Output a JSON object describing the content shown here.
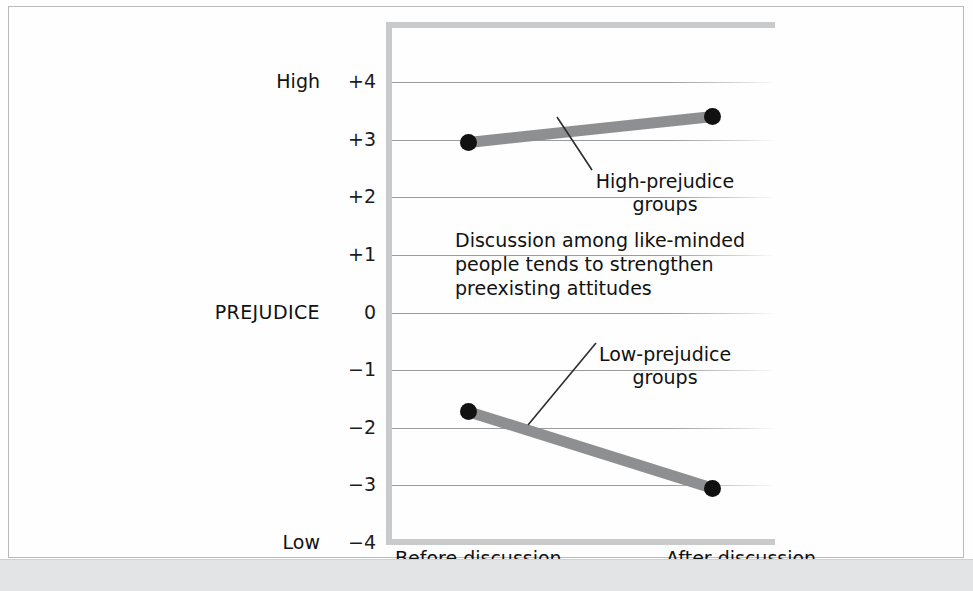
{
  "chart_data": {
    "type": "line",
    "title": "",
    "xlabel": "",
    "ylabel": "PREJUDICE",
    "ylim": [
      -4,
      4
    ],
    "grid": true,
    "legend_position": "inline-annotation",
    "categories": [
      "Before discussion",
      "After discussion"
    ],
    "ytick_labels": [
      "+4",
      "+3",
      "+2",
      "+1",
      "0",
      "−1",
      "−2",
      "−3",
      "−4"
    ],
    "ytick_values": [
      4,
      3,
      2,
      1,
      0,
      -1,
      -2,
      -3,
      -4
    ],
    "axis_end_labels": {
      "high": "High",
      "low": "Low"
    },
    "series": [
      {
        "name": "High-prejudice groups",
        "values": [
          2.95,
          3.4
        ]
      },
      {
        "name": "Low-prejudice groups",
        "values": [
          -1.72,
          -3.05
        ]
      }
    ],
    "annotations": [
      {
        "name": "high-prejudice-label",
        "text_line1": "High-prejudice",
        "text_line2": "groups"
      },
      {
        "name": "low-prejudice-label",
        "text_line1": "Low-prejudice",
        "text_line2": "groups"
      },
      {
        "name": "conclusion-note",
        "text_line1": "Discussion among like-minded",
        "text_line2": "people tends to strengthen",
        "text_line3": "preexisting attitudes"
      }
    ],
    "colors": {
      "series_line": "#8d8f91",
      "marker": "#111111",
      "gridline": "#9a9b9e",
      "axis_frame": "#c9cacc",
      "text": "#111111",
      "bottom_band": "#e3e4e6"
    }
  }
}
